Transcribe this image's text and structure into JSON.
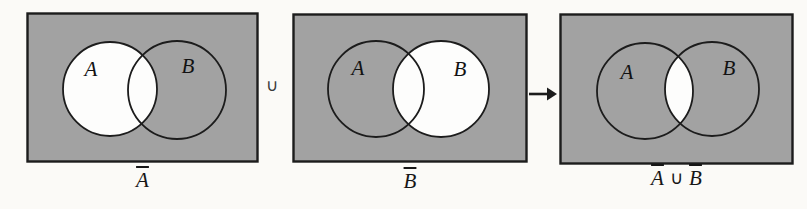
{
  "colors": {
    "shade_gray": "#a2a2a2",
    "outline": "#1c1c1c",
    "region_white": "#fdfdfc",
    "page_background": "#fbfaf7"
  },
  "diagrams": [
    {
      "set_a": "A",
      "set_b": "B",
      "caption_bar": "A"
    },
    {
      "set_a": "A",
      "set_b": "B",
      "caption_bar": "B"
    },
    {
      "set_a": "A",
      "set_b": "B",
      "caption_left_bar": "A",
      "caption_operator": "∪",
      "caption_right_bar": "B"
    }
  ],
  "connectors": {
    "union_operator": "∪"
  }
}
